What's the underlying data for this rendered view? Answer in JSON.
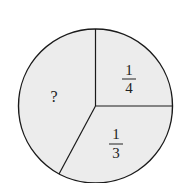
{
  "diagram": {
    "type": "pie-fraction-circle",
    "fill_color": "#ececec",
    "stroke_color": "#1a1a1a",
    "sectors": [
      {
        "label_numerator": "1",
        "label_denominator": "4",
        "position": "upper-right"
      },
      {
        "label_numerator": "1",
        "label_denominator": "3",
        "position": "bottom"
      },
      {
        "label": "?",
        "position": "left"
      }
    ]
  }
}
